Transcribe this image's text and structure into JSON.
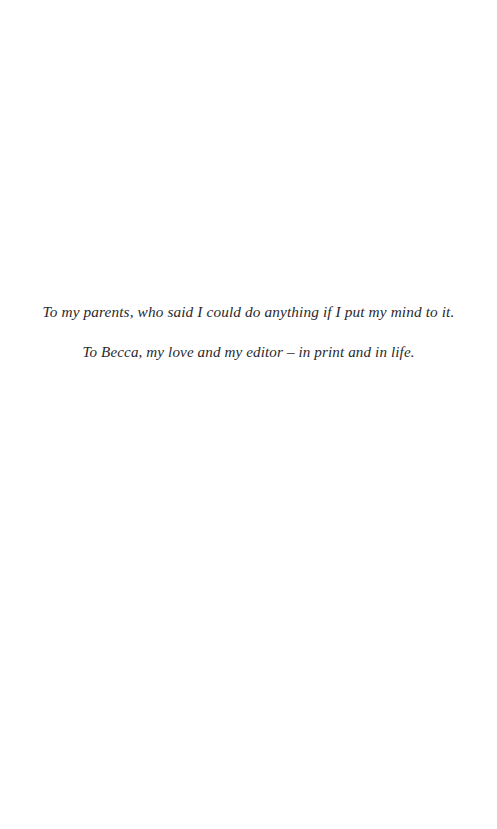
{
  "page": {
    "type": "book-dedication-page",
    "background_color": "#ffffff",
    "ink_color": "#2a2a2e",
    "width": 497,
    "height": 829
  },
  "dedication": {
    "lines": [
      {
        "text": "To my parents, who said I could do anything if I put my mind to it.",
        "alignment": "center"
      },
      {
        "text": "To Becca, my love and my editor – in print and in life.",
        "alignment": "center"
      }
    ]
  }
}
